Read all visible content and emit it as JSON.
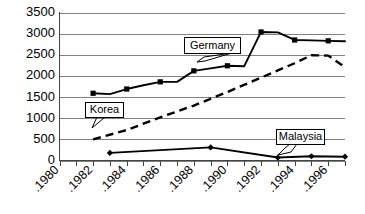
{
  "chart_data": {
    "type": "line",
    "title": "",
    "subtitle": "",
    "xlabel": "",
    "ylabel": "",
    "xlim": [
      1980,
      1997
    ],
    "ylim": [
      0,
      3500
    ],
    "ytick_step": 500,
    "grid": true,
    "legend_position": "inline-callouts",
    "x_tick_interval_years": 1,
    "x_label_interval_years": 2,
    "xtick_labels": [
      "1980",
      "1982",
      "1984",
      "1986",
      "1988",
      "1990",
      "1992",
      "1994",
      "1996"
    ],
    "xtick_label_years": [
      1980,
      1982,
      1984,
      1986,
      1988,
      1990,
      1992,
      1994,
      1996
    ],
    "ytick_labels": [
      "0",
      "500",
      "1000",
      "1500",
      "2000",
      "2500",
      "3000",
      "3500"
    ],
    "ytick_values": [
      0,
      500,
      1000,
      1500,
      2000,
      2500,
      3000,
      3500
    ],
    "series": [
      {
        "name": "Germany",
        "style": "solid",
        "marker": "square",
        "color": "#000000",
        "x": [
          1982,
          1983,
          1984,
          1985,
          1986,
          1987,
          1988,
          1989,
          1990,
          1991,
          1992,
          1993,
          1994,
          1995,
          1996,
          1997
        ],
        "values": [
          1590,
          1570,
          1690,
          1780,
          1860,
          1860,
          2120,
          2180,
          2240,
          2230,
          3040,
          3030,
          2850,
          2840,
          2830,
          2820
        ]
      },
      {
        "name": "Korea",
        "style": "dashed",
        "marker": "none",
        "color": "#000000",
        "x": [
          1982,
          1984,
          1986,
          1988,
          1990,
          1992,
          1994,
          1995,
          1996,
          1997
        ],
        "values": [
          500,
          720,
          1020,
          1300,
          1620,
          1960,
          2300,
          2490,
          2480,
          2210
        ]
      },
      {
        "name": "Malaysia",
        "style": "solid",
        "marker": "diamond",
        "color": "#000000",
        "x": [
          1983,
          1989,
          1993,
          1995,
          1997
        ],
        "values": [
          180,
          310,
          70,
          100,
          90
        ]
      }
    ],
    "annotations": [
      {
        "label": "Germany",
        "target_year": 1990,
        "target_value": 2240
      },
      {
        "label": "Korea",
        "target_year": 1982,
        "target_value": 520
      },
      {
        "label": "Malaysia",
        "target_year": 1993,
        "target_value": 80
      }
    ]
  }
}
